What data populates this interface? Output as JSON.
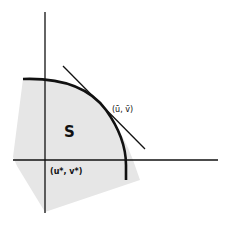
{
  "diagram": {
    "region_label": "S",
    "tangent_point_label": "(ū, v̄)",
    "origin_label": "(u*, v*)",
    "colors": {
      "region_fill": "#e6e6e6",
      "lines": "#111111",
      "background": "#ffffff"
    }
  }
}
